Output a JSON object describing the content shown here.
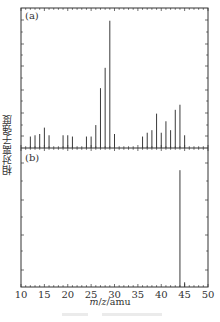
{
  "chart_data": {
    "type": "bar",
    "title": "",
    "xlabel": "m/z/amu",
    "ylabel": "相对离子强度",
    "xlim": [
      10,
      50
    ],
    "xticks": [
      10,
      15,
      20,
      25,
      30,
      35,
      40,
      45,
      50
    ],
    "grid": false,
    "legend": null,
    "panels": [
      {
        "label": "(a)",
        "x": [
          12,
          13,
          14,
          15,
          16,
          19,
          20,
          21,
          24,
          25,
          26,
          27,
          28,
          29,
          30,
          36,
          37,
          38,
          39,
          40,
          41,
          42,
          43,
          44,
          45
        ],
        "values": [
          9,
          10,
          11,
          16,
          10,
          10,
          10,
          9,
          9,
          9,
          18,
          47,
          63,
          100,
          11,
          9,
          12,
          14,
          27,
          12,
          21,
          14,
          30,
          34,
          10
        ],
        "ylim": [
          0,
          110
        ]
      },
      {
        "label": "(b)",
        "x": [
          44,
          45
        ],
        "values": [
          100,
          4
        ],
        "ylim": [
          0,
          119
        ]
      }
    ]
  },
  "labels": {
    "panel_a": "(a)",
    "panel_b": "(b)",
    "ylabel": "相对离子强度",
    "xlabel_m": "m",
    "xlabel_slash1": "/",
    "xlabel_z": "z",
    "xlabel_unit": "/amu"
  }
}
